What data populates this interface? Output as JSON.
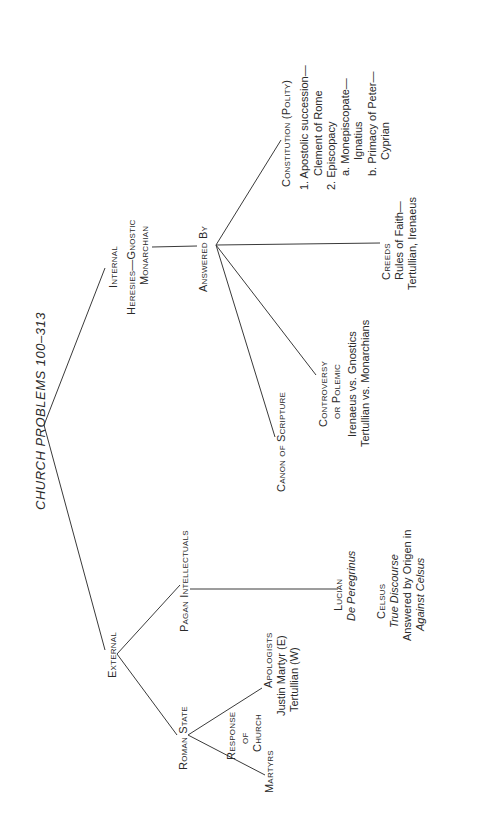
{
  "title": "CHURCH PROBLEMS 100–313",
  "internal": {
    "label": "Internal",
    "heresies_line1": "Heresies—Gnostic",
    "heresies_line2": "Monarchian",
    "answered_by": "Answered By",
    "constitution": {
      "heading": "Constitution (Polity)",
      "items": [
        "1.  Apostolic succession—",
        "Clement of Rome",
        "2.  Episcopacy",
        "a.  Monepiscopate—",
        "Ignatius",
        "b.  Primacy of Peter—",
        "Cyprian"
      ]
    },
    "creeds": {
      "heading": "Creeds",
      "line1": "Rules of Faith—",
      "line2": "Tertullian, Irenaeus"
    },
    "controversy": {
      "heading1": "Controversy",
      "heading2": "or Polemic",
      "line1": "Irenaeus vs. Gnostics",
      "line2": "Tertullian vs. Monarchians"
    },
    "canon": "Canon of Scripture"
  },
  "external": {
    "label": "External",
    "pagan_intellectuals": "Pagan Intellectuals",
    "lucian": {
      "name": "Lucian",
      "work": "De Peregrinus"
    },
    "celsus": {
      "name": "Celsus",
      "work": "True Discourse",
      "answer_line1": "Answered by Origen in",
      "answer_line2": "Against Celsus"
    },
    "roman_state": "Roman State",
    "response": {
      "line1": "Response",
      "line2": "of",
      "line3": "Church"
    },
    "martyrs": "Martyrs",
    "apologists": {
      "heading": "Apologists",
      "line1": "Justin Martyr (E)",
      "line2": "Tertullian (W)"
    }
  }
}
